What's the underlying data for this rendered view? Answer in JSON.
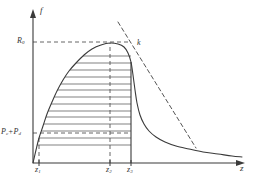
{
  "figure": {
    "kind": "line-plot-with-hatched-area",
    "axes": {
      "y_axis_name": "f",
      "x_axis_name": "z",
      "y_ticks": [
        {
          "name": "R0",
          "base": "R",
          "sub": "0",
          "value_px": 42
        },
        {
          "name": "Pc+Pd",
          "base_1": "P",
          "sub_1": "c",
          "plus": "+",
          "base_2": "P",
          "sub_2": "d",
          "value_px": 133
        }
      ],
      "x_ticks": [
        {
          "name": "z1",
          "base": "z",
          "sub": "1",
          "value_px": 39
        },
        {
          "name": "z2",
          "base": "z",
          "sub": "2",
          "value_px": 110
        },
        {
          "name": "z3",
          "base": "z",
          "sub": "3",
          "value_px": 131
        }
      ]
    },
    "annotations": [
      {
        "name": "point-k",
        "base": "k",
        "sub": "",
        "x_px": 137,
        "y_px": 47
      }
    ],
    "colors": {
      "curve": "#3a3a3a",
      "axis": "#3a3a3a",
      "dashed": "#555555",
      "hatch": "#4a4a4a",
      "background": "#ffffff"
    }
  },
  "chart_data": {
    "type": "line",
    "title": "",
    "xlabel": "z",
    "ylabel": "f",
    "grid": false,
    "legend": null,
    "xlim": [
      0,
      253
    ],
    "ylim": [
      0,
      179
    ],
    "axis_tick_labels": {
      "x": [
        "z1",
        "z2",
        "z3"
      ],
      "y": [
        "R0",
        "Pc+Pd"
      ]
    },
    "series": [
      {
        "name": "f(z)",
        "style": "solid",
        "description": "rises steeply from z1, peaks at z2 at level R0, falls sharply after z3, then long flat tail to the right",
        "points": [
          [
            33,
            163
          ],
          [
            36,
            150
          ],
          [
            39,
            138
          ],
          [
            43,
            126
          ],
          [
            47,
            114
          ],
          [
            52,
            102
          ],
          [
            57,
            91
          ],
          [
            63,
            80
          ],
          [
            69,
            71
          ],
          [
            76,
            63
          ],
          [
            84,
            55
          ],
          [
            92,
            49
          ],
          [
            101,
            45
          ],
          [
            110,
            43
          ],
          [
            118,
            44
          ],
          [
            124,
            47
          ],
          [
            128,
            53
          ],
          [
            131,
            62
          ],
          [
            133,
            75
          ],
          [
            135,
            90
          ],
          [
            137,
            103
          ],
          [
            140,
            115
          ],
          [
            144,
            124
          ],
          [
            149,
            131
          ],
          [
            156,
            137
          ],
          [
            165,
            142
          ],
          [
            176,
            146
          ],
          [
            189,
            149
          ],
          [
            203,
            152
          ],
          [
            218,
            154
          ],
          [
            232,
            156
          ],
          [
            242,
            157
          ]
        ]
      },
      {
        "name": "tangent-line-through-k",
        "style": "dashed",
        "description": "straight dashed line passing through point k on the falling branch, extending up-left above the peak and down-right toward the tail",
        "points": [
          [
            118,
            22
          ],
          [
            196,
            148
          ]
        ]
      }
    ],
    "guides": [
      {
        "name": "hline-R0",
        "style": "dashed",
        "from": [
          33,
          42
        ],
        "to": [
          131,
          42
        ]
      },
      {
        "name": "hline-PcPd",
        "style": "dashed",
        "from": [
          33,
          133
        ],
        "to": [
          131,
          133
        ]
      },
      {
        "name": "vline-z1",
        "style": "dashed",
        "from": [
          39,
          163
        ],
        "to": [
          39,
          137
        ]
      },
      {
        "name": "vline-z2",
        "style": "dashed",
        "from": [
          110,
          163
        ],
        "to": [
          110,
          43
        ]
      },
      {
        "name": "vline-z3",
        "style": "solid",
        "from": [
          131,
          163
        ],
        "to": [
          131,
          62
        ]
      }
    ],
    "hatching": {
      "name": "hatched-area",
      "orientation": "horizontal",
      "line_count": 14,
      "description": "horizontal line fill bounded left by the rising curve, right by the vertical at z3, top near R0 and bottom at the Pc+Pd level",
      "y_values": [
        56,
        63,
        70,
        77,
        84,
        90,
        97,
        104,
        111,
        117,
        124,
        131,
        138,
        145
      ]
    }
  }
}
